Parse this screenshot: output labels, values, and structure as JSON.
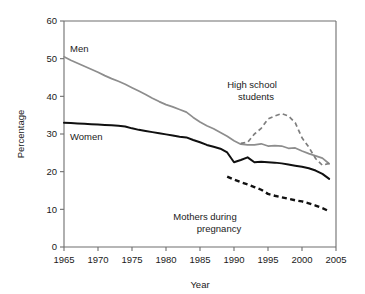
{
  "chart_data": {
    "type": "line",
    "title": "",
    "xlabel": "Year",
    "ylabel": "Percentage",
    "xlim": [
      1965,
      2005
    ],
    "ylim": [
      0,
      60
    ],
    "xticks": [
      1965,
      1970,
      1975,
      1980,
      1985,
      1990,
      1995,
      2000,
      2005
    ],
    "yticks": [
      0,
      10,
      20,
      30,
      40,
      50,
      60
    ],
    "xticklabels": [
      "1965",
      "1970",
      "1975",
      "1980",
      "1985",
      "1990",
      "1995",
      "2000",
      "2005"
    ],
    "yticklabels": [
      "0",
      "10",
      "20",
      "30",
      "40",
      "50",
      "60"
    ],
    "grid": false,
    "legend_position": "inline-annotations",
    "series": [
      {
        "name": "Men",
        "style": "solid",
        "color": "#8d8d8d",
        "label_text": "Men",
        "x": [
          1965,
          1966,
          1967,
          1968,
          1969,
          1970,
          1971,
          1972,
          1973,
          1974,
          1975,
          1976,
          1977,
          1978,
          1979,
          1980,
          1981,
          1982,
          1983,
          1984,
          1985,
          1986,
          1987,
          1988,
          1989,
          1990,
          1991,
          1992,
          1993,
          1994,
          1995,
          1996,
          1997,
          1998,
          1999,
          2000,
          2001,
          2002,
          2003,
          2004
        ],
        "values": [
          50.5,
          49.6,
          48.8,
          48.0,
          47.2,
          46.4,
          45.5,
          44.7,
          44.0,
          43.2,
          42.3,
          41.4,
          40.5,
          39.5,
          38.6,
          37.8,
          37.2,
          36.5,
          35.8,
          34.4,
          33.2,
          32.2,
          31.4,
          30.4,
          29.4,
          28.2,
          27.3,
          27.1,
          27.1,
          27.4,
          26.8,
          26.9,
          26.8,
          26.2,
          26.3,
          25.5,
          24.8,
          24.2,
          23.6,
          22.1
        ]
      },
      {
        "name": "Women",
        "style": "solid",
        "color": "#101010",
        "label_text": "Women",
        "x": [
          1965,
          1966,
          1967,
          1968,
          1969,
          1970,
          1971,
          1972,
          1973,
          1974,
          1975,
          1976,
          1977,
          1978,
          1979,
          1980,
          1981,
          1982,
          1983,
          1984,
          1985,
          1986,
          1987,
          1988,
          1989,
          1990,
          1991,
          1992,
          1993,
          1994,
          1995,
          1996,
          1997,
          1998,
          1999,
          2000,
          2001,
          2002,
          2003,
          2004
        ],
        "values": [
          33.0,
          32.9,
          32.8,
          32.7,
          32.6,
          32.5,
          32.4,
          32.3,
          32.2,
          32.0,
          31.5,
          31.1,
          30.8,
          30.5,
          30.2,
          29.9,
          29.6,
          29.3,
          29.1,
          28.4,
          27.8,
          27.1,
          26.6,
          26.1,
          25.1,
          22.5,
          23.1,
          23.8,
          22.5,
          22.6,
          22.5,
          22.4,
          22.2,
          21.9,
          21.6,
          21.3,
          20.9,
          20.3,
          19.4,
          18.1
        ]
      },
      {
        "name": "High school students",
        "style": "dashed",
        "color": "#7e7e7e",
        "label_text": "High school students",
        "x": [
          1991,
          1992,
          1993,
          1994,
          1995,
          1996,
          1997,
          1998,
          1999,
          2000,
          2001,
          2002,
          2003,
          2004
        ],
        "values": [
          27.5,
          27.8,
          30.0,
          31.5,
          34.0,
          34.8,
          35.4,
          34.8,
          33.0,
          29.0,
          26.5,
          23.5,
          21.7,
          22.2
        ]
      },
      {
        "name": "Mothers during pregnancy",
        "style": "dashed-bold",
        "color": "#101010",
        "label_text": "Mothers during pregnancy",
        "x": [
          1989,
          1990,
          1991,
          1992,
          1993,
          1994,
          1995,
          1996,
          1997,
          1998,
          1999,
          2000,
          2001,
          2002,
          2003,
          2004
        ],
        "values": [
          18.7,
          17.9,
          17.2,
          16.6,
          15.9,
          15.2,
          14.1,
          13.6,
          13.2,
          12.8,
          12.4,
          12.1,
          11.6,
          11.0,
          10.3,
          9.5
        ]
      }
    ],
    "annotations": [
      {
        "id": "men-label",
        "text": "Men",
        "x_px": 70,
        "y_px": 52
      },
      {
        "id": "women-label",
        "text": "Women",
        "x_px": 70,
        "y_px": 140
      },
      {
        "id": "hs-label-line1",
        "text": "High school",
        "x_px": 252,
        "y_px": 88
      },
      {
        "id": "hs-label-line2",
        "text": "students",
        "x_px": 256,
        "y_px": 100
      },
      {
        "id": "mothers-label-line1",
        "text": "Mothers during",
        "x_px": 205,
        "y_px": 220
      },
      {
        "id": "mothers-label-line2",
        "text": "pregnancy",
        "x_px": 219,
        "y_px": 232
      }
    ]
  }
}
